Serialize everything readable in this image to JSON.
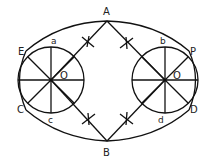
{
  "diagram": {
    "points": {
      "A": "A",
      "B": "B",
      "E": "E",
      "C": "C",
      "P": "P",
      "D": "D",
      "left_center": "O",
      "right_center": "O",
      "a": "a",
      "b": "b",
      "c": "c",
      "d": "d"
    },
    "colors": {
      "stroke": "#111111",
      "background": "#ffffff"
    }
  }
}
